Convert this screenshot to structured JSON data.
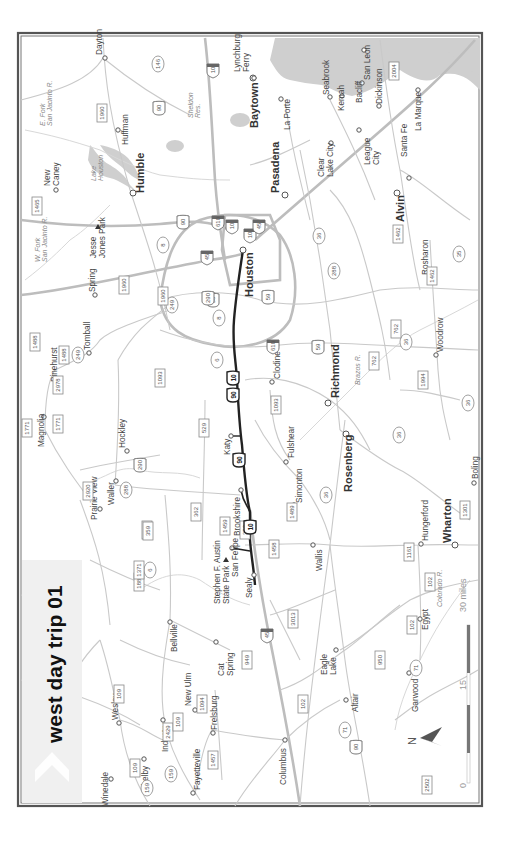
{
  "map": {
    "title": "west day trip 01",
    "route_color": "#222222",
    "road_color": "#c9c9c9",
    "water_color": "#cfcfcf",
    "major_cities": [
      "Houston",
      "Humble",
      "Baytown",
      "Pasadena",
      "Alvin",
      "Richmond",
      "Rosenberg",
      "Wharton"
    ],
    "towns": [
      "Dayton",
      "Huffman",
      "New Caney",
      "Lynchburg Ferry",
      "La Porte",
      "Seabrook",
      "Kemah",
      "Bacliff",
      "San Leon",
      "Dickinson",
      "Clear Lake City",
      "League City",
      "Santa Fe",
      "La Marque",
      "Spring",
      "Tomball",
      "Pinehurst",
      "Magnolia",
      "Waller",
      "Hockley",
      "Prairie View",
      "Katy",
      "Brookshire",
      "San Felipe",
      "Sealy",
      "Fulshear",
      "Simonton",
      "Clodine",
      "Wallis",
      "Rosharon",
      "Woodrow",
      "Hungerford",
      "Boling",
      "Bellville",
      "Cat Spring",
      "New Ulm",
      "Industry",
      "Wesley",
      "Shelby",
      "Winedale",
      "Fayetteville",
      "Frelsburg",
      "Columbus",
      "Eagle Lake",
      "Altair",
      "Garwood",
      "Egypt"
    ],
    "parks": [
      "Jesse Jones Park",
      "Stephen F. Austin State Park"
    ],
    "water_labels": [
      "E. Fork San Jacinto R.",
      "W. Fork San Jacinto R.",
      "Lake Houston",
      "Sheldon Res.",
      "Brazos R.",
      "Colorado R."
    ],
    "shields": {
      "interstate": [
        "10",
        "10",
        "10",
        "10",
        "45",
        "45",
        "45",
        "610",
        "610"
      ],
      "us": [
        "90",
        "90",
        "59",
        "59",
        "90",
        "290",
        "290",
        "90"
      ],
      "state": [
        "146",
        "8",
        "8",
        "249",
        "249",
        "6",
        "6",
        "288",
        "288",
        "35",
        "36",
        "36",
        "36",
        "36",
        "36",
        "159",
        "159",
        "71",
        "71",
        "71"
      ],
      "farm_road": [
        "1960",
        "1960",
        "1960",
        "1465",
        "1488",
        "1488",
        "2978",
        "1771",
        "1771",
        "2920",
        "529",
        "362",
        "359",
        "359",
        "1887",
        "1371",
        "1459",
        "1458",
        "1489",
        "1093",
        "1093",
        "359",
        "2004",
        "1462",
        "1462",
        "762",
        "762",
        "1994",
        "1301",
        "1161",
        "102",
        "102",
        "102",
        "3013",
        "950",
        "949",
        "2429",
        "1094",
        "109",
        "109",
        "109",
        "2502",
        "1457",
        "2437",
        "331"
      ]
    },
    "route_shields": [
      "10",
      "90",
      "90",
      "10"
    ],
    "scale": {
      "labels": [
        "0",
        "15",
        "30 miles"
      ]
    },
    "north_label": "N"
  }
}
